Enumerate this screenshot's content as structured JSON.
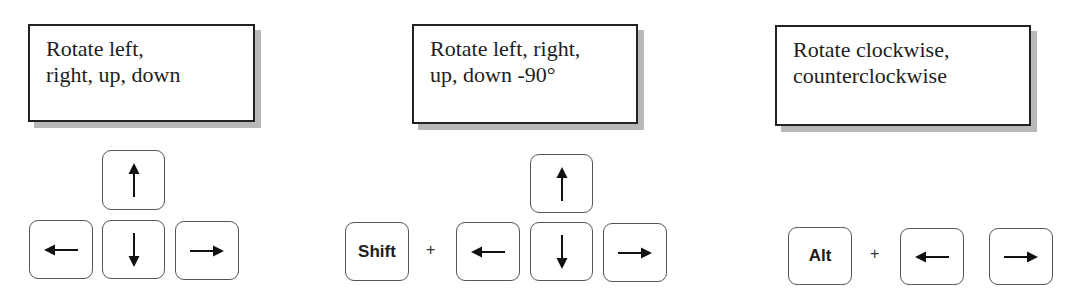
{
  "groups": [
    {
      "caption": [
        "Rotate left,",
        "right, up, down"
      ],
      "keys": {
        "up": "arrow-up",
        "left": "arrow-left",
        "down": "arrow-down",
        "right": "arrow-right"
      }
    },
    {
      "caption": [
        "Rotate left, right,",
        "up, down -90°"
      ],
      "modifier": "Shift",
      "plus": "+",
      "keys": {
        "up": "arrow-up",
        "left": "arrow-left",
        "down": "arrow-down",
        "right": "arrow-right"
      }
    },
    {
      "caption": [
        "Rotate clockwise,",
        "counterclockwise"
      ],
      "modifier": "Alt",
      "plus": "+",
      "keys": {
        "left": "arrow-left",
        "right": "arrow-right"
      }
    }
  ],
  "colors": {
    "border": "#222222",
    "shadow": "#b8b8b8",
    "key_border": "#555555",
    "text": "#1e1e1e"
  }
}
